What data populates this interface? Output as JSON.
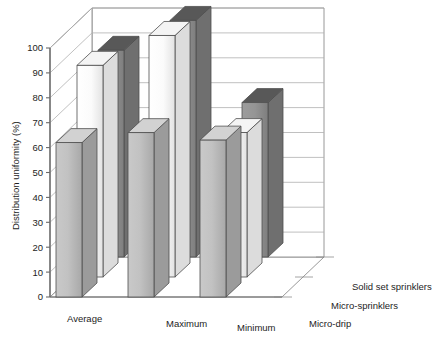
{
  "chart_data": {
    "type": "bar",
    "title": "",
    "subtitle": "",
    "xlabel": "",
    "ylabel": "Distribution uniformity (%)",
    "ylim": [
      0,
      100
    ],
    "yticks": [
      0,
      10,
      20,
      30,
      40,
      50,
      60,
      70,
      80,
      90,
      100
    ],
    "ytick_labels": [
      "0",
      "10",
      "20",
      "30",
      "40",
      "50",
      "60",
      "70",
      "80",
      "90",
      "100"
    ],
    "categories": [
      "Average",
      "Maximum",
      "Minimum"
    ],
    "series": [
      {
        "name": "Micro-drip",
        "values": [
          62,
          66,
          63
        ],
        "color": "#b4b4b4"
      },
      {
        "name": "Micro-sprinklers",
        "values": [
          85,
          97,
          58
        ],
        "color": "#fbfbfb"
      },
      {
        "name": "Solid set sprinklers",
        "values": [
          83,
          95,
          62
        ],
        "color": "#8e8e8e"
      }
    ],
    "grid": true,
    "grid_axis": "y",
    "legend_position": "depth-axis",
    "projection": "3d",
    "style": "grayscale"
  },
  "axis": {
    "y_title": "Distribution uniformity (%)",
    "ticks": [
      "0",
      "10",
      "20",
      "30",
      "40",
      "50",
      "60",
      "70",
      "80",
      "90",
      "100"
    ],
    "categories": [
      "Average",
      "Maximum",
      "Minimum"
    ],
    "series_labels": [
      "Micro-drip",
      "Micro-sprinklers",
      "Solid set sprinklers"
    ]
  },
  "colors": {
    "series_1_face": "#b9b9b9",
    "series_1_side": "#9b9b9b",
    "series_1_top": "#d2d2d2",
    "series_2_face": "#fdfdfd",
    "series_2_side": "#d9d9d9",
    "series_2_top": "#f2f2f2",
    "series_3_face": "#8f8f8f",
    "series_3_side": "#6f6f6f",
    "series_3_top": "#5e5e5e",
    "grid": "#aeaeae",
    "axis": "#6a6a6a",
    "text": "#1d1d1d",
    "background": "#ffffff"
  }
}
